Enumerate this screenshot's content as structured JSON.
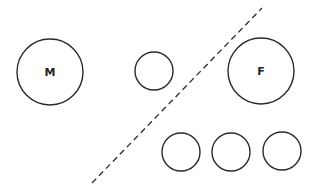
{
  "diagram": {
    "background": "#ffffff",
    "stroke_color": "#2a2a2a",
    "circles": [
      {
        "id": "M",
        "label": "M",
        "cx": 50,
        "cy": 72,
        "r": 33
      },
      {
        "id": "small-left",
        "label": "",
        "cx": 154,
        "cy": 71,
        "r": 19
      },
      {
        "id": "F",
        "label": "F",
        "cx": 261,
        "cy": 71,
        "r": 33
      },
      {
        "id": "small-bottom-1",
        "label": "",
        "cx": 181,
        "cy": 152,
        "r": 19
      },
      {
        "id": "small-bottom-2",
        "label": "",
        "cx": 231,
        "cy": 152,
        "r": 19
      },
      {
        "id": "small-bottom-3",
        "label": "",
        "cx": 282,
        "cy": 151,
        "r": 19
      }
    ],
    "divider": {
      "style": "dashed",
      "x1": 92,
      "y1": 183,
      "x2": 262,
      "y2": 8
    },
    "labels": {
      "M": "M",
      "F": "F"
    }
  }
}
